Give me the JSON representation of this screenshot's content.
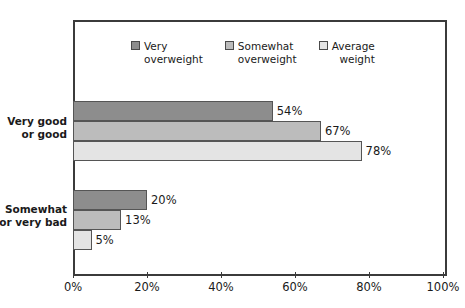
{
  "chart_data": {
    "type": "bar",
    "orientation": "horizontal",
    "title": "",
    "xlabel": "",
    "ylabel": "",
    "xlim": [
      0,
      100
    ],
    "xticks": [
      "0%",
      "20%",
      "40%",
      "60%",
      "80%",
      "100%"
    ],
    "xtick_values": [
      0,
      20,
      40,
      60,
      80,
      100
    ],
    "grid": false,
    "legend_position": "top-center",
    "categories": [
      "Very good\nor good",
      "Somewhat\nor very bad"
    ],
    "series": [
      {
        "name": "Very\noverweight",
        "legend_label": "Very\noverweight",
        "color": "#8d8d8d",
        "values": [
          54,
          20
        ],
        "labels": [
          "54%",
          "20%"
        ]
      },
      {
        "name": "Somewhat\noverweight",
        "legend_label": "Somewhat\noverweight",
        "color": "#bcbcbc",
        "values": [
          67,
          13
        ],
        "labels": [
          "67%",
          "13%"
        ]
      },
      {
        "name": "Average\nweight",
        "legend_label": "Average\nweight",
        "color": "#e4e4e4",
        "values": [
          78,
          5
        ],
        "labels": [
          "78%",
          "5%"
        ]
      }
    ],
    "colors": {
      "very_overweight": "#8d8d8d",
      "somewhat_overweight": "#bcbcbc",
      "average_weight": "#e4e4e4",
      "frame": "#3b3b3b",
      "bar_border": "#555555",
      "text": "#1a1a1a",
      "background": "#ffffff"
    }
  }
}
